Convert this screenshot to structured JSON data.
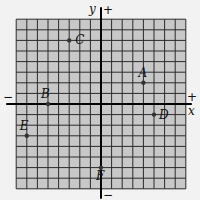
{
  "diagram": {
    "type": "coordinate-plane",
    "grid": {
      "x_min": -8,
      "x_max": 8,
      "y_min": -8,
      "y_max": 8,
      "cell_px": 10.6
    },
    "axes": {
      "x_label": "x",
      "y_label": "y",
      "x_positive": "+",
      "x_negative": "−",
      "y_positive": "+",
      "y_negative": "−"
    },
    "colors": {
      "grid_fill": "#c8c8c8",
      "grid_line": "#2a2a2a",
      "axis": "#000000",
      "point": "#333333"
    },
    "points": [
      {
        "label": "A",
        "x": 4,
        "y": 2
      },
      {
        "label": "B",
        "x": -5,
        "y": 0
      },
      {
        "label": "C",
        "x": -3,
        "y": 6
      },
      {
        "label": "D",
        "x": 5,
        "y": -1
      },
      {
        "label": "E",
        "x": -7,
        "y": -3
      },
      {
        "label": "F",
        "x": 0,
        "y": -6
      }
    ]
  }
}
